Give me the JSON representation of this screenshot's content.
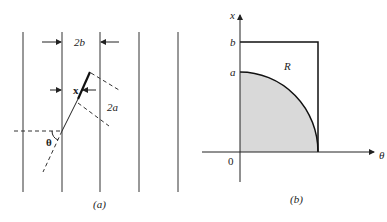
{
  "panel_a": {
    "caption": "(a)",
    "spacing_label": "2b",
    "needle_length_label": "2a",
    "distance_label": "x",
    "angle_label": "θ"
  },
  "panel_b": {
    "caption": "(b)",
    "y_axis_label": "x",
    "x_axis_label": "θ",
    "origin_label": "0",
    "b_tick_label": "b",
    "a_tick_label": "a",
    "region_label": "R"
  },
  "colors": {
    "line": "#222222",
    "shaded_region": "#d9d9d9",
    "background": "#ffffff"
  }
}
